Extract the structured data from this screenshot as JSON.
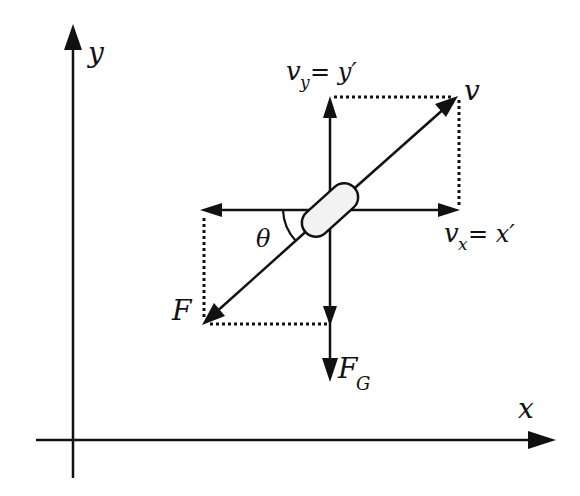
{
  "diagram": {
    "colors": {
      "stroke": "#111111",
      "capsule_fill": "#f2f2f2",
      "background": "#ffffff"
    },
    "axes": {
      "x_label": "x",
      "y_label": "y"
    },
    "labels": {
      "v_y_base": "v",
      "v_y_sub": "y",
      "v_y_eq": " = y′",
      "v": "v",
      "v_x_base": "v",
      "v_x_sub": "x",
      "v_x_eq": " = x′",
      "theta": "θ",
      "F": "F",
      "F_G_base": "F",
      "F_G_sub": "G"
    },
    "elements": [
      {
        "id": "y-axis",
        "type": "arrow",
        "from": [
          73,
          478
        ],
        "to": [
          73,
          26
        ]
      },
      {
        "id": "x-axis",
        "type": "arrow",
        "from": [
          36,
          440
        ],
        "to": [
          555,
          440
        ]
      },
      {
        "id": "velocity-v",
        "type": "arrow",
        "from": [
          330,
          210
        ],
        "to": [
          457,
          97
        ]
      },
      {
        "id": "force-F",
        "type": "arrow",
        "from": [
          330,
          210
        ],
        "to": [
          203,
          324
        ]
      },
      {
        "id": "v_y",
        "type": "arrow",
        "from": [
          330,
          210
        ],
        "to": [
          330,
          97
        ]
      },
      {
        "id": "v_x",
        "type": "arrow",
        "from": [
          330,
          210
        ],
        "to": [
          458,
          210
        ]
      },
      {
        "id": "F_x",
        "type": "arrow",
        "from": [
          330,
          210
        ],
        "to": [
          202,
          210
        ]
      },
      {
        "id": "F_G",
        "type": "arrow",
        "from": [
          330,
          210
        ],
        "to": [
          330,
          380
        ]
      },
      {
        "id": "body",
        "type": "capsule",
        "center": [
          330,
          210
        ],
        "length": 64,
        "width": 28,
        "angle_deg": -42
      }
    ]
  }
}
